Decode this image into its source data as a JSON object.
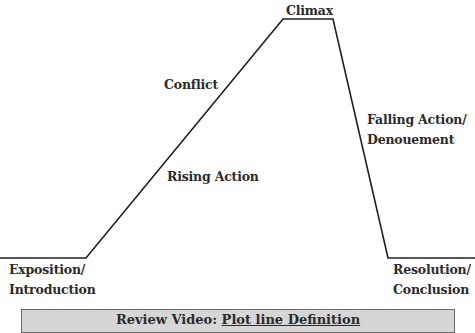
{
  "diagram": {
    "title": "Plot line",
    "stroke_color": "#1f1f1f",
    "stages": [
      {
        "id": "exposition",
        "label_line1": "Exposition/",
        "label_line2": "Introduction"
      },
      {
        "id": "rising",
        "label": "Rising Action"
      },
      {
        "id": "conflict",
        "label": "Conflict"
      },
      {
        "id": "climax",
        "label": "Climax"
      },
      {
        "id": "falling",
        "label_line1": "Falling Action/",
        "label_line2": "Denouement"
      },
      {
        "id": "resolution",
        "label_line1": "Resolution/",
        "label_line2": "Conclusion"
      }
    ],
    "path_points": [
      [
        0,
        258
      ],
      [
        86,
        258
      ],
      [
        283,
        19
      ],
      [
        333,
        19
      ],
      [
        388,
        258
      ],
      [
        475,
        258
      ]
    ]
  },
  "banner": {
    "prefix": "Review Video: ",
    "link_text": "Plot line Definition",
    "background": "#d6d6d6"
  }
}
